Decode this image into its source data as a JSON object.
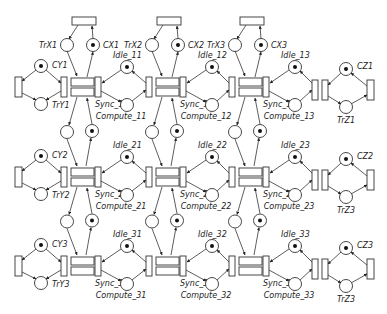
{
  "diagram": {
    "type": "petri-net",
    "rows": [
      {
        "id": 1,
        "cy": 87,
        "left": {
          "top_place": "CY1",
          "bottom_place": "TrY1",
          "top_marked": true
        },
        "right": {
          "top_place": "CZ1",
          "bottom_place": "TrZ1",
          "top_marked": true
        },
        "cells": [
          {
            "sync": "Sync_11",
            "idle": "Idle_11",
            "compute": "Compute_11"
          },
          {
            "sync": "Sync_12",
            "idle": "Idle_12",
            "compute": "Compute_12"
          },
          {
            "sync": "Sync_13",
            "idle": "Idle_13",
            "compute": "Compute_13"
          }
        ]
      },
      {
        "id": 2,
        "cy": 177,
        "left": {
          "top_place": "CY2",
          "bottom_place": "TrY2",
          "top_marked": true
        },
        "right": {
          "top_place": "CZ2",
          "bottom_place": "TrZ3",
          "top_marked": true
        },
        "cells": [
          {
            "sync": "Sync_21",
            "idle": "Idle_21",
            "compute": "Compute_21"
          },
          {
            "sync": "Sync_22",
            "idle": "Idle_22",
            "compute": "Compute_22"
          },
          {
            "sync": "Sync_23",
            "idle": "Idle_23",
            "compute": "Compute_23"
          }
        ]
      },
      {
        "id": 3,
        "cy": 266,
        "left": {
          "top_place": "CY3",
          "bottom_place": "TrY3",
          "top_marked": true
        },
        "right": {
          "top_place": "CZ3",
          "bottom_place": "TrZ3",
          "top_marked": true
        },
        "cells": [
          {
            "sync": "Sync_31",
            "idle": "Idle_31",
            "compute": "Compute_31"
          },
          {
            "sync": "Sync_32",
            "idle": "Idle_32",
            "compute": "Compute_32"
          },
          {
            "sync": "Sync_33",
            "idle": "Idle_33",
            "compute": "Compute_33"
          }
        ]
      }
    ],
    "columns": [
      {
        "x": 61,
        "top_empty": "TrX1",
        "top_marked": "CX1"
      },
      {
        "x": 146,
        "top_empty": "TrX2",
        "top_marked": "CX2"
      },
      {
        "x": 229,
        "top_empty": "TrX3",
        "top_marked": "CX3"
      }
    ]
  }
}
